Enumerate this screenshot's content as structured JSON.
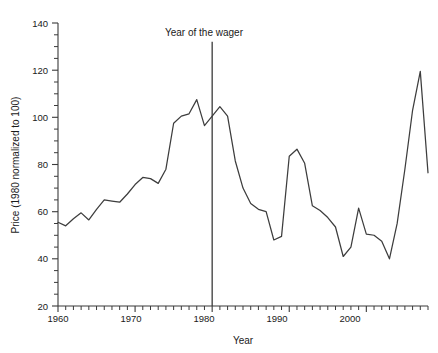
{
  "chart_data": {
    "type": "line",
    "title": "",
    "xlabel": "Year",
    "ylabel": "Price (1980 normalized to 100)",
    "xlim": [
      1960,
      2008
    ],
    "ylim": [
      20,
      140
    ],
    "grid": false,
    "legend": null,
    "x_ticks_major": [
      1960,
      1970,
      1980,
      1990,
      2000
    ],
    "x_tick_labels": [
      "1960",
      "1970",
      "1980",
      "1990",
      "2000"
    ],
    "x_ticks_minor_step": 1,
    "y_ticks_major": [
      20,
      40,
      60,
      80,
      100,
      120,
      140
    ],
    "y_tick_labels": [
      "20",
      "40",
      "60",
      "80",
      "100",
      "120",
      "140"
    ],
    "y_ticks_minor_step": 5,
    "annotations": [
      {
        "name": "year-of-the-wager",
        "text": "Year of the wager",
        "x": 1980,
        "type": "vertical-line-with-label",
        "line_top": 132,
        "line_bottom": 20,
        "label_y": 136
      }
    ],
    "series": [
      {
        "name": "Price index (1980 = 100)",
        "color": "#3d3d3d",
        "x": [
          1960,
          1961,
          1962,
          1963,
          1964,
          1965,
          1966,
          1967,
          1968,
          1969,
          1970,
          1971,
          1972,
          1973,
          1974,
          1975,
          1976,
          1977,
          1978,
          1979,
          1980,
          1981,
          1982,
          1983,
          1984,
          1985,
          1986,
          1987,
          1988,
          1989,
          1990,
          1991,
          1992,
          1993,
          1994,
          1995,
          1996,
          1997,
          1998,
          1999,
          2000,
          2001,
          2002,
          2003,
          2004,
          2005,
          2006,
          2007,
          2008
        ],
        "values": [
          55.5,
          54.0,
          57.0,
          59.5,
          56.5,
          61.0,
          65.0,
          64.5,
          64.0,
          67.5,
          71.5,
          74.5,
          74.0,
          72.0,
          78.0,
          97.5,
          100.5,
          101.5,
          107.5,
          96.5,
          100.5,
          104.5,
          100.5,
          81.5,
          70.0,
          63.5,
          61.0,
          60.0,
          48.0,
          49.5,
          83.5,
          86.5,
          80.5,
          62.5,
          60.5,
          57.5,
          53.5,
          41.0,
          45.0,
          61.5,
          50.5,
          50.0,
          47.5,
          40.0,
          35.5,
          41.0,
          38.0,
          35.5,
          41.5
        ],
        "tail_x": [
          2004,
          2005,
          2006,
          2007,
          2008
        ],
        "tail_values": [
          55.0,
          78.0,
          103.0,
          119.5,
          76.5
        ]
      }
    ],
    "polyline_points_normalized": [
      [
        1960,
        55.5
      ],
      [
        1961,
        54.0
      ],
      [
        1962,
        57.0
      ],
      [
        1963,
        59.5
      ],
      [
        1964,
        56.5
      ],
      [
        1965,
        61.0
      ],
      [
        1966,
        65.0
      ],
      [
        1967,
        64.5
      ],
      [
        1968,
        64.0
      ],
      [
        1969,
        67.5
      ],
      [
        1970,
        71.5
      ],
      [
        1971,
        74.5
      ],
      [
        1972,
        74.0
      ],
      [
        1973,
        72.0
      ],
      [
        1974,
        78.0
      ],
      [
        1975,
        97.5
      ],
      [
        1976,
        100.5
      ],
      [
        1977,
        101.5
      ],
      [
        1978,
        107.5
      ],
      [
        1979,
        96.5
      ],
      [
        1980,
        100.5
      ],
      [
        1981,
        104.5
      ],
      [
        1982,
        100.5
      ],
      [
        1983,
        81.5
      ],
      [
        1984,
        70.0
      ],
      [
        1985,
        63.5
      ],
      [
        1986,
        61.0
      ],
      [
        1987,
        60.0
      ],
      [
        1988,
        48.0
      ],
      [
        1989,
        49.5
      ],
      [
        1990,
        83.5
      ],
      [
        1991,
        86.5
      ],
      [
        1992,
        80.5
      ],
      [
        1993,
        62.5
      ],
      [
        1994,
        60.5
      ],
      [
        1995,
        57.5
      ],
      [
        1996,
        53.5
      ],
      [
        1997,
        41.0
      ],
      [
        1998,
        45.0
      ],
      [
        1999,
        61.5
      ],
      [
        2000,
        50.5
      ],
      [
        2001,
        50.0
      ],
      [
        2002,
        47.5
      ],
      [
        2003,
        40.0
      ],
      [
        2004,
        35.5
      ],
      [
        2005,
        41.0
      ],
      [
        2006,
        38.0
      ],
      [
        2007,
        35.5
      ],
      [
        2008,
        41.5
      ]
    ]
  },
  "figure": {
    "background_color": "#ffffff",
    "line_color": "#3d3d3d",
    "axis_color": "#3a3a3a",
    "text_color": "#1a1a1a"
  }
}
